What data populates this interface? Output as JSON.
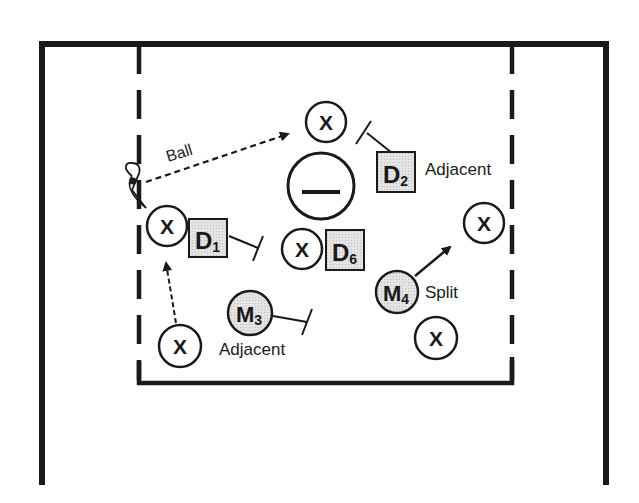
{
  "diagram": {
    "type": "lacrosse-defense-play",
    "labels": {
      "ball": "Ball",
      "adjacent_d2": "Adjacent",
      "adjacent_m3": "Adjacent",
      "split": "Split"
    },
    "offense_marker": "X",
    "goal_symbol": "—",
    "defenders": [
      {
        "id": "D1",
        "letter": "D",
        "sub": "1"
      },
      {
        "id": "D2",
        "letter": "D",
        "sub": "2"
      },
      {
        "id": "D6",
        "letter": "D",
        "sub": "6"
      }
    ],
    "midfielders": [
      {
        "id": "M3",
        "letter": "M",
        "sub": "3"
      },
      {
        "id": "M4",
        "letter": "M",
        "sub": "4"
      }
    ],
    "colors": {
      "line": "#1a1a1a",
      "defender_fill": "#d9d9d9",
      "background": "#ffffff"
    }
  }
}
